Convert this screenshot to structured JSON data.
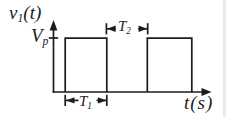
{
  "figure": {
    "type": "rectangular-pulse-train-waveform",
    "background_color": "#ffffff",
    "line_color": "#1c1c1c",
    "labels": {
      "y_axis": {
        "base": "v",
        "sub": "1",
        "args": "(t)"
      },
      "amplitude": {
        "base": "V",
        "sub": "p"
      },
      "pulse_gap": {
        "base": "T",
        "sub": "2"
      },
      "pulse_width": {
        "base": "T",
        "sub": "1"
      },
      "x_axis": {
        "base": "t",
        "args": "(s)"
      }
    },
    "waveform": {
      "pulses_visible": 2,
      "amplitude_level": "Vp",
      "low_level": "0"
    }
  }
}
